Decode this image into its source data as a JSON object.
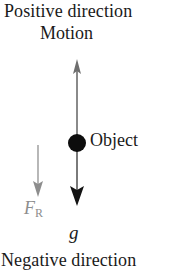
{
  "figure": {
    "title_top": "Positive direction",
    "motion_label": "Motion",
    "object_label": "Object",
    "title_bottom": "Negative direction",
    "gravity_symbol": "g",
    "resistance_symbol": "F",
    "resistance_subscript": "R",
    "background_color": "#ffffff",
    "axis_color": "#8a8a8a",
    "object_color": "#0d0d0d",
    "resistance_color": "#8d8d8d",
    "text_color": "#1a1a1a"
  },
  "diagram_data": {
    "type": "free-body-diagram",
    "description": "Vertical free-body / motion diagram of an object moving upward with gravity and air resistance acting downward",
    "axis": {
      "orientation": "vertical",
      "positive_direction": "up",
      "negative_direction": "down",
      "top_label": "Positive direction",
      "bottom_label": "Negative direction",
      "x_position_px": 77,
      "top_px": 60,
      "bottom_px": 205
    },
    "object": {
      "label": "Object",
      "center_px": [
        77,
        143
      ],
      "radius_px": 9
    },
    "vectors": [
      {
        "name": "motion",
        "label": "Motion",
        "direction": "up",
        "x_px": 77,
        "tail_px": 143,
        "head_px": 60,
        "color": "#8a8a8a"
      },
      {
        "name": "gravity",
        "label": "g",
        "direction": "down",
        "x_px": 77,
        "tail_px": 143,
        "head_px": 205,
        "color": "#4a4a4a"
      },
      {
        "name": "air-resistance",
        "label": "F_R",
        "direction": "down",
        "x_px": 38,
        "tail_px": 145,
        "head_px": 196,
        "color": "#9a9a9a"
      }
    ]
  }
}
